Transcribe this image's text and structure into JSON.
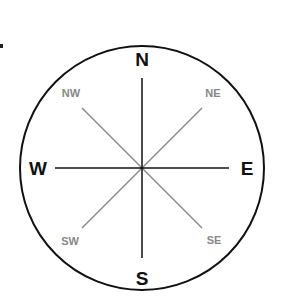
{
  "compass": {
    "cardinal": {
      "north": "N",
      "south": "S",
      "east": "E",
      "west": "W"
    },
    "intercardinal": {
      "northwest": "NW",
      "northeast": "NE",
      "southwest": "SW",
      "southeast": "SE"
    },
    "colors": {
      "cardinal": "#111111",
      "intercardinal": "#888888",
      "circle": "#111111"
    }
  }
}
